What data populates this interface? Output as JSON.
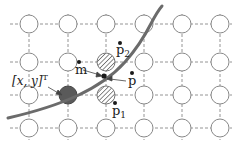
{
  "diagram": {
    "type": "pixel-grid-curve-sampling",
    "grid": {
      "columns_x": [
        29,
        68,
        106,
        144,
        182,
        220
      ],
      "rows_y": [
        24,
        62,
        95,
        128
      ],
      "node_radius": 9,
      "line_style": "dashed",
      "line_color": "#888888",
      "node_fill": "#ffffff",
      "node_stroke": "#888888"
    },
    "special_nodes": [
      {
        "name": "filled-node",
        "col": 1,
        "row": 2,
        "fill": "#5a5a5a",
        "style": "solid"
      },
      {
        "name": "hatched-node-p2",
        "col": 2,
        "row": 1,
        "style": "hatched"
      },
      {
        "name": "hatched-node-p1",
        "col": 2,
        "row": 2,
        "style": "hatched"
      }
    ],
    "curve": {
      "color": "#6b6b6b",
      "stroke_width": 3
    },
    "labels": {
      "p2": {
        "base": "p",
        "sub": "2"
      },
      "p1": {
        "base": "p",
        "sub": "1"
      },
      "m": {
        "base": "m"
      },
      "p": {
        "base": "p"
      },
      "xy": {
        "text": "[x, y]",
        "sup": "T"
      }
    },
    "colors": {
      "text": "#222222",
      "point": "#1a1a1a"
    }
  }
}
